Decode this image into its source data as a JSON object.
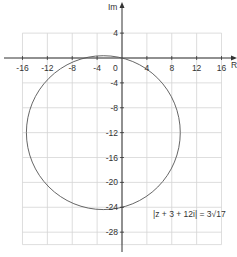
{
  "chart_data": {
    "type": "line",
    "title": "",
    "xlabel": "Re",
    "ylabel": "Im",
    "xlim": [
      -16,
      16
    ],
    "ylim": [
      -30,
      4
    ],
    "grid": true,
    "x_ticks": [
      -16,
      -12,
      -8,
      -4,
      0,
      4,
      8,
      12,
      16
    ],
    "y_ticks": [
      4,
      -4,
      -8,
      -12,
      -16,
      -20,
      -24,
      -28
    ],
    "origin_label": "0",
    "series": [
      {
        "name": "circle",
        "shape": "circle",
        "center": [
          -3,
          -12
        ],
        "radius": 12.369,
        "radius_label": "3√17"
      }
    ],
    "annotations": [
      {
        "text": "|z + 3 + 12i| = 3√17",
        "x": 10,
        "y": -25
      }
    ]
  },
  "labels": {
    "x_axis": "Re",
    "y_axis": "Im",
    "origin": "0",
    "equation": "|z + 3 + 12i|  = 3√17",
    "xticks": [
      "-16",
      "-12",
      "-8",
      "-4",
      "4",
      "8",
      "12",
      "16"
    ],
    "yticks": [
      "4",
      "-4",
      "-8",
      "-12",
      "-16",
      "-20",
      "-24",
      "-28"
    ]
  },
  "colors": {
    "grid": "#d4d4d4",
    "axis": "#333333",
    "curve": "#555555"
  }
}
